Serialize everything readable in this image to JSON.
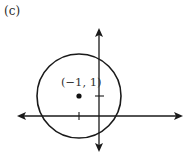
{
  "figure": {
    "panel_label": "(c)",
    "point_label": "(−1, 1)",
    "colors": {
      "ink": "#1a1a1a",
      "background": "#ffffff"
    }
  },
  "diagram": {
    "type": "circle-on-cartesian-axes",
    "center": {
      "x": -1,
      "y": 1
    },
    "center_pixel": {
      "x": 79,
      "y": 96
    },
    "radius_pixel": 42,
    "origin_pixel": {
      "x": 99,
      "y": 116
    },
    "unit_pixel": 20,
    "ticks": {
      "x_axis": [
        -1
      ],
      "y_axis": [
        1
      ]
    }
  }
}
